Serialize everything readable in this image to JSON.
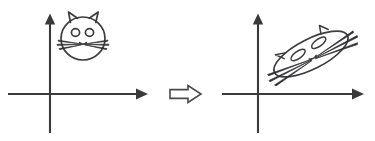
{
  "figure": {
    "background_color": "#ffffff",
    "ink_color": "#3d3d40",
    "axis_color": "#3a3a3c",
    "width": 375,
    "height": 141
  },
  "panels": [
    {
      "id": "source",
      "label": "original cat on coordinate axes",
      "axes": {
        "origin": {
          "x": 50,
          "y": 94
        },
        "x_axis": {
          "start_x": 8,
          "end_x": 147,
          "y": 94,
          "arrow": "right"
        },
        "y_axis": {
          "x": 50,
          "start_y": 133,
          "end_y": 14,
          "arrow": "up"
        }
      },
      "shape": {
        "name": "cat-face",
        "kind": "circle",
        "center": {
          "x": 83,
          "y": 38
        },
        "radius": 22,
        "rotation_deg": 0,
        "ears": 2,
        "eyes": 2,
        "whiskers_per_side": 3
      }
    },
    {
      "id": "target",
      "label": "sheared cat on coordinate axes",
      "axes": {
        "origin": {
          "x": 258,
          "y": 94
        },
        "x_axis": {
          "start_x": 222,
          "end_x": 363,
          "y": 94,
          "arrow": "right"
        },
        "y_axis": {
          "x": 258,
          "start_y": 133,
          "end_y": 14,
          "arrow": "up"
        }
      },
      "shape": {
        "name": "cat-face-transformed",
        "kind": "ellipse",
        "center": {
          "x": 311,
          "y": 54
        },
        "radius_major": 41,
        "radius_minor": 15,
        "rotation_deg": -27,
        "ears": 2,
        "eyes": 2,
        "whiskers_per_side": 3
      }
    }
  ],
  "transform_arrow": {
    "name": "implies-arrow",
    "glyph": "hollow-right-arrow",
    "x": 170,
    "y": 94,
    "width": 31,
    "height": 17,
    "fill": "#ffffff",
    "stroke": "#4a4a4d"
  }
}
